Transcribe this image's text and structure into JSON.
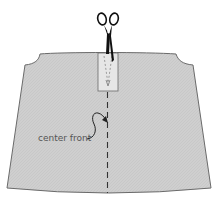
{
  "diagram": {
    "label_center_front": "center front",
    "colors": {
      "fabric_fill": "#cfcfcf",
      "fabric_outline": "#6a6a6a",
      "placket_fill": "#e6e6e6",
      "dash_line": "#333333",
      "scissors": "#111111",
      "label_text": "#555555"
    },
    "icons": [
      "scissors-icon",
      "curved-arrow-icon"
    ]
  }
}
